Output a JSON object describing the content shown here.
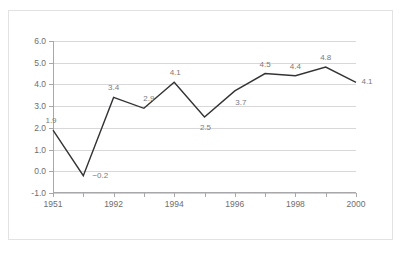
{
  "title": {
    "text": "",
    "cropped": true
  },
  "chart_data": {
    "type": "line",
    "title": "",
    "xlabel": "",
    "ylabel": "",
    "ylim": [
      -1.0,
      6.0
    ],
    "ytick_step": 1.0,
    "grid": true,
    "legend": false,
    "x": [
      "1951",
      "",
      "1992",
      "",
      "1994",
      "",
      "1996",
      "",
      "1998",
      "",
      "2000"
    ],
    "categories": [
      "1951",
      "",
      "1992",
      "",
      "1994",
      "",
      "1996",
      "",
      "1998",
      "",
      "2000"
    ],
    "xtick_labels": [
      "1951",
      "1992",
      "1994",
      "1996",
      "1998",
      "2000"
    ],
    "ytick_labels": [
      "6.0",
      "5.0",
      "4.0",
      "3.0",
      "2.0",
      "1.0",
      "0.0",
      "-1.0"
    ],
    "ytick_values": [
      6.0,
      5.0,
      4.0,
      3.0,
      2.0,
      1.0,
      0.0,
      -1.0
    ],
    "values": [
      1.9,
      -0.2,
      3.4,
      2.9,
      4.1,
      2.5,
      3.7,
      4.5,
      4.4,
      4.8,
      4.1
    ],
    "point_labels": [
      "1.9",
      "−0.2",
      "3.4",
      "2.9",
      "4.1",
      "2.5",
      "3.7",
      "4.5",
      "4.4",
      "4.8",
      "4.1"
    ],
    "line_color": "#333333",
    "grid_color": "#d8d8da",
    "axis_color": "#a8a8ab",
    "label_color": "#6e6e70",
    "point_label_color": "#7a7a7c",
    "background_color": "#ffffff",
    "border_color": "#e2e2e4"
  }
}
